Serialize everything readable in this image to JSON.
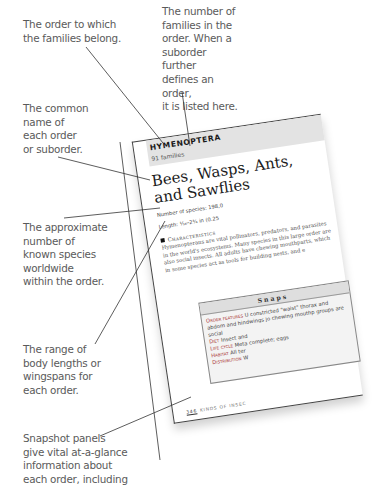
{
  "annotations": [
    {
      "id": "order",
      "text": "The order to which\nthe families belong."
    },
    {
      "id": "families",
      "text": "The number of\nfamilies in the\norder. When a\nsuborder further\ndefines an order,\nit is listed here."
    },
    {
      "id": "common_name",
      "text": "The common\nname of\neach order\nor suborder."
    },
    {
      "id": "species",
      "text": "The approximate\nnumber of\nknown species\nworldwide\nwithin the order."
    },
    {
      "id": "range",
      "text": "The range of\nbody lengths or\nwingspans for\neach order."
    },
    {
      "id": "snapshot",
      "text": "Snapshot panels\ngive vital at-a-glance\ninformation about\neach order, including"
    }
  ],
  "book_page": {
    "order_name": "HYMENOPTERA",
    "families": "91 families",
    "common_name": "Bees, Wasps, Ants, and Sawflies",
    "species_label": "Number of species: 198,0",
    "length_label": "Length: ¹⁄₁₆–2¾ in (0.25",
    "characteristics_heading": "Characteristics",
    "characteristics_text": "Hymenopterans are vital pollinators, predators, and parasites in the world's ecosystems. Many species in this large order are also social insects. All adults have chewing mouthparts, which in some species act as tools for building nests, and e",
    "snapshot": {
      "title": "Snaps",
      "rows": [
        {
          "label": "Order features",
          "value": "U constricted \"waist\" thorax and abdom and hindwings jo chewing mouthp groups are social"
        },
        {
          "label": "Diet",
          "value": "Insect and"
        },
        {
          "label": "Life cycle",
          "value": "Meta complete; eggs"
        },
        {
          "label": "Habitat",
          "value": "All ter"
        },
        {
          "label": "Distribution",
          "value": "W"
        }
      ]
    },
    "footer": {
      "page_number": "346",
      "section": "KINDS OF INSEC"
    }
  }
}
